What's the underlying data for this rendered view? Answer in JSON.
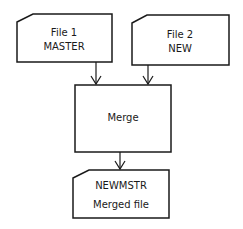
{
  "diagram": {
    "type": "flowchart",
    "nodes": [
      {
        "id": "file1",
        "shape": "card",
        "lines": [
          "File 1",
          "MASTER"
        ]
      },
      {
        "id": "file2",
        "shape": "card",
        "lines": [
          "File 2",
          "NEW"
        ]
      },
      {
        "id": "merge",
        "shape": "process",
        "lines": [
          "Merge"
        ]
      },
      {
        "id": "newmstr",
        "shape": "card",
        "lines": [
          "NEWMSTR",
          "Merged file"
        ]
      }
    ],
    "edges": [
      {
        "from": "file1",
        "to": "merge"
      },
      {
        "from": "file2",
        "to": "merge"
      },
      {
        "from": "merge",
        "to": "newmstr"
      }
    ],
    "colors": {
      "stroke": "#1a1a1a",
      "fill": "#ffffff",
      "text": "#1a1a1a"
    }
  }
}
